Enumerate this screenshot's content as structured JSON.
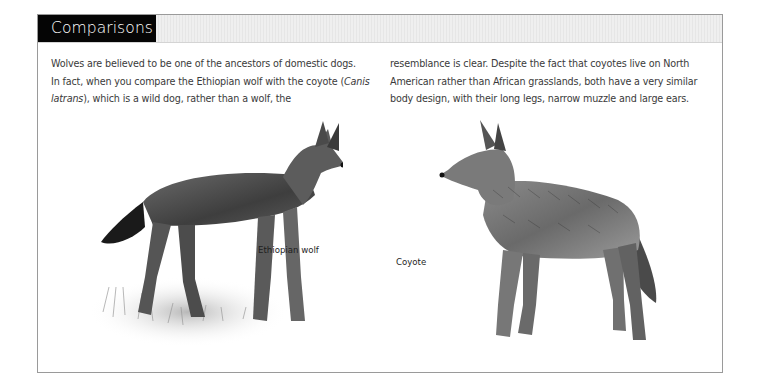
{
  "section": {
    "title": "Comparisons"
  },
  "body": {
    "left_column": {
      "line1": "Wolves are believed to be one of the ancestors of domestic dogs.",
      "line2_prefix": "In fact, when you compare the Ethiopian wolf with the coyote (",
      "line2_italic": "Canis",
      "line3_italic": "latrans",
      "line3_suffix": "), which is a wild dog, rather than a wolf, the"
    },
    "right_column": {
      "line1": "resemblance is clear. Despite the fact that coyotes live on North",
      "line2": "American rather than African grasslands, both have a very similar",
      "line3": "body design, with their long legs, narrow muzzle and large ears."
    }
  },
  "illustrations": [
    {
      "icon": "ethiopian-wolf-illustration",
      "caption": "Ethiopian wolf"
    },
    {
      "icon": "coyote-illustration",
      "caption": "Coyote"
    }
  ],
  "colors": {
    "title_bg": "#050505",
    "title_text": "#ffffff",
    "band_bg": "#ebebeb",
    "border": "#9a9a9a",
    "body_text": "#3a3a3a"
  }
}
